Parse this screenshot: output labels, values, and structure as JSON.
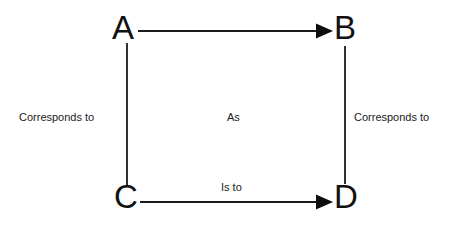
{
  "diagram": {
    "type": "analogy-square",
    "background_color": "#ffffff",
    "stroke_color": "#111111",
    "nodes": [
      {
        "id": "A",
        "label": "A",
        "position": "top-left"
      },
      {
        "id": "B",
        "label": "B",
        "position": "top-right"
      },
      {
        "id": "C",
        "label": "C",
        "position": "bottom-left"
      },
      {
        "id": "D",
        "label": "D",
        "position": "bottom-right"
      }
    ],
    "edges": [
      {
        "id": "a-to-b",
        "from": "A",
        "to": "B",
        "orientation": "horizontal",
        "arrowhead": "filled-triangle-right",
        "label": ""
      },
      {
        "id": "c-to-d",
        "from": "C",
        "to": "D",
        "orientation": "horizontal",
        "arrowhead": "filled-triangle-right",
        "label": "Is to"
      },
      {
        "id": "a-to-c",
        "from": "A",
        "to": "C",
        "orientation": "vertical",
        "arrowhead": "none",
        "label": "Corresponds to"
      },
      {
        "id": "b-to-d",
        "from": "B",
        "to": "D",
        "orientation": "vertical",
        "arrowhead": "none",
        "label": "Corresponds to"
      }
    ],
    "labels": {
      "left": "Corresponds to",
      "right": "Corresponds to",
      "center": "As",
      "bottom": "Is to"
    }
  }
}
